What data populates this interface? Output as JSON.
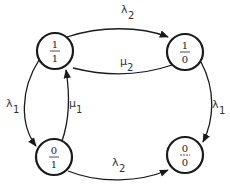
{
  "diagram": {
    "type": "state-transition",
    "nodes": [
      {
        "id": "s11",
        "top": "1",
        "bottom": "1"
      },
      {
        "id": "s10",
        "top": "1",
        "bottom": "0"
      },
      {
        "id": "s01",
        "top": "0",
        "bottom": "1"
      },
      {
        "id": "s00",
        "top": "0",
        "bottom": "0"
      }
    ],
    "edges": [
      {
        "from": "s11",
        "to": "s10",
        "symbol": "λ",
        "sub": "2"
      },
      {
        "from": "s10",
        "to": "s11",
        "symbol": "μ",
        "sub": "2"
      },
      {
        "from": "s11",
        "to": "s01",
        "symbol": "λ",
        "sub": "1"
      },
      {
        "from": "s01",
        "to": "s11",
        "symbol": "μ",
        "sub": "1"
      },
      {
        "from": "s10",
        "to": "s00",
        "symbol": "λ",
        "sub": "1"
      },
      {
        "from": "s01",
        "to": "s00",
        "symbol": "λ",
        "sub": "2"
      }
    ]
  }
}
